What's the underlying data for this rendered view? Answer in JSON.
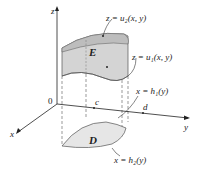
{
  "diagram": {
    "axes": {
      "z": "z",
      "x": "x",
      "y": "y",
      "origin": "0"
    },
    "region_labels": {
      "solid": "E",
      "base": "D"
    },
    "tick_labels": {
      "c": "c",
      "d": "d"
    },
    "annotations": {
      "top_surface": "z = u₂(x, y)",
      "bottom_surface": "z = u₁(x, y)",
      "boundary_h1": "x = h₁(y)",
      "boundary_h2": "x = h₂(y)"
    },
    "colors": {
      "solid_fill": "#d4d4d4",
      "solid_top": "#c2c2c2",
      "base_fill": "#e6e6e6",
      "line": "#333333"
    }
  }
}
